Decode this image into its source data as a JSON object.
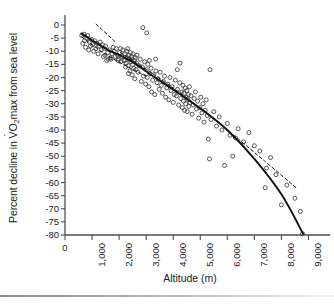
{
  "figure": {
    "background_color": "#ffffff",
    "axis_color": "#4d4d4d",
    "marker_color": "#3a3a3a",
    "fit_color": "#111111",
    "bottom_rule": "gradient-gray"
  },
  "axis_titles": {
    "y_prefix": "Percent decline in ",
    "y_v": "V",
    "y_o": "O",
    "y_sub": "2",
    "y_suffix": "max from sea level",
    "y_full": "Percent decline in VO2max from sea level",
    "x": "Altitude (m)"
  },
  "chart_data": {
    "type": "scatter",
    "title": "",
    "xlabel": "Altitude (m)",
    "ylabel": "Percent decline in VO2max from sea level",
    "xlim": [
      0,
      9500
    ],
    "ylim": [
      -80,
      2
    ],
    "grid": false,
    "legend": "none",
    "xticks": [
      0,
      1000,
      2000,
      3000,
      4000,
      5000,
      6000,
      7000,
      8000,
      9000
    ],
    "xtick_labels": [
      "0",
      "1,000",
      "2,000",
      "3,000",
      "4,000",
      "5,000",
      "6,000",
      "7,000",
      "8,000",
      "9,000"
    ],
    "yticks": [
      0,
      -5,
      -10,
      -15,
      -20,
      -25,
      -30,
      -35,
      -40,
      -45,
      -50,
      -55,
      -60,
      -65,
      -70,
      -75,
      -80
    ],
    "ytick_labels": [
      "0",
      "-5",
      "-10",
      "-15",
      "-20",
      "-25",
      "-30",
      "-35",
      "-40",
      "-45",
      "-50",
      "-55",
      "-60",
      "-65",
      "-70",
      "-75",
      "-80"
    ],
    "marker": "open-circle",
    "marker_size": 4,
    "points": [
      [
        620,
        -4.0
      ],
      [
        660,
        -7.0
      ],
      [
        700,
        -3.5
      ],
      [
        720,
        -6.0
      ],
      [
        760,
        -8.5
      ],
      [
        800,
        -5.0
      ],
      [
        840,
        -4.0
      ],
      [
        880,
        -9.5
      ],
      [
        900,
        -6.5
      ],
      [
        940,
        -8.0
      ],
      [
        980,
        -5.5
      ],
      [
        1020,
        -7.5
      ],
      [
        1060,
        -10.0
      ],
      [
        1100,
        -6.0
      ],
      [
        1140,
        -9.0
      ],
      [
        1180,
        -7.0
      ],
      [
        1220,
        -11.0
      ],
      [
        1260,
        -8.0
      ],
      [
        1300,
        -6.5
      ],
      [
        1340,
        -9.5
      ],
      [
        1380,
        -7.5
      ],
      [
        1420,
        -12.0
      ],
      [
        1460,
        -9.0
      ],
      [
        1500,
        -8.0
      ],
      [
        1540,
        -13.5
      ],
      [
        1580,
        -10.5
      ],
      [
        1600,
        -13.0
      ],
      [
        1640,
        -9.5
      ],
      [
        1680,
        -12.5
      ],
      [
        1700,
        -13.0
      ],
      [
        1740,
        -11.0
      ],
      [
        1780,
        -8.5
      ],
      [
        1820,
        -10.0
      ],
      [
        1860,
        -12.0
      ],
      [
        1900,
        -9.0
      ],
      [
        1940,
        -11.5
      ],
      [
        1980,
        -13.0
      ],
      [
        2020,
        -10.5
      ],
      [
        2060,
        -14.0
      ],
      [
        2100,
        -12.0
      ],
      [
        2140,
        -9.5
      ],
      [
        2180,
        -13.5
      ],
      [
        2220,
        -11.0
      ],
      [
        2240,
        -16.0
      ],
      [
        2260,
        -14.5
      ],
      [
        2280,
        -10.0
      ],
      [
        2300,
        -12.5
      ],
      [
        2320,
        -9.0
      ],
      [
        2340,
        -15.5
      ],
      [
        2360,
        -11.5
      ],
      [
        2380,
        -13.0
      ],
      [
        2400,
        -17.5
      ],
      [
        2420,
        -10.5
      ],
      [
        2440,
        -14.0
      ],
      [
        2460,
        -12.0
      ],
      [
        2480,
        -19.0
      ],
      [
        2500,
        -15.0
      ],
      [
        2520,
        -11.0
      ],
      [
        2540,
        -16.5
      ],
      [
        2560,
        -13.5
      ],
      [
        2580,
        -20.5
      ],
      [
        2600,
        -12.5
      ],
      [
        2620,
        -17.0
      ],
      [
        2640,
        -14.5
      ],
      [
        2660,
        -11.5
      ],
      [
        2700,
        -18.0
      ],
      [
        2740,
        -15.5
      ],
      [
        2780,
        -13.0
      ],
      [
        2820,
        -21.5
      ],
      [
        2860,
        -16.0
      ],
      [
        2880,
        -1.0
      ],
      [
        2900,
        -19.5
      ],
      [
        2940,
        -14.0
      ],
      [
        2980,
        -22.5
      ],
      [
        3000,
        -17.0
      ],
      [
        3020,
        -3.0
      ],
      [
        3040,
        -20.0
      ],
      [
        3060,
        -15.0
      ],
      [
        3100,
        -23.5
      ],
      [
        3140,
        -18.5
      ],
      [
        3180,
        -16.5
      ],
      [
        3200,
        -25.5
      ],
      [
        3240,
        -21.0
      ],
      [
        3280,
        -19.0
      ],
      [
        3320,
        -26.5
      ],
      [
        3360,
        -17.5
      ],
      [
        3400,
        -22.0
      ],
      [
        3440,
        -20.5
      ],
      [
        3480,
        -24.5
      ],
      [
        3520,
        -18.0
      ],
      [
        3560,
        -23.0
      ],
      [
        3600,
        -26.0
      ],
      [
        3640,
        -21.5
      ],
      [
        3680,
        -19.5
      ],
      [
        3720,
        -27.5
      ],
      [
        3760,
        -24.0
      ],
      [
        3800,
        -22.5
      ],
      [
        3840,
        -28.5
      ],
      [
        3880,
        -20.0
      ],
      [
        3920,
        -25.0
      ],
      [
        3960,
        -23.5
      ],
      [
        4000,
        -29.5
      ],
      [
        4040,
        -26.5
      ],
      [
        4080,
        -21.0
      ],
      [
        4120,
        -27.0
      ],
      [
        4160,
        -24.5
      ],
      [
        4200,
        -30.5
      ],
      [
        4240,
        -22.0
      ],
      [
        4280,
        -28.0
      ],
      [
        4320,
        -25.5
      ],
      [
        4340,
        -31.5
      ],
      [
        4360,
        -23.0
      ],
      [
        4380,
        -29.0
      ],
      [
        4400,
        -26.0
      ],
      [
        4420,
        -32.5
      ],
      [
        4440,
        -24.0
      ],
      [
        4460,
        -30.0
      ],
      [
        4480,
        -27.5
      ],
      [
        4500,
        -25.0
      ],
      [
        4520,
        -33.0
      ],
      [
        4540,
        -28.5
      ],
      [
        4560,
        -26.5
      ],
      [
        4580,
        -31.0
      ],
      [
        4600,
        -23.5
      ],
      [
        4620,
        -29.5
      ],
      [
        4660,
        -27.0
      ],
      [
        4700,
        -34.0
      ],
      [
        4740,
        -30.5
      ],
      [
        4780,
        -28.0
      ],
      [
        4820,
        -25.5
      ],
      [
        4860,
        -32.0
      ],
      [
        4900,
        -29.0
      ],
      [
        4940,
        -35.5
      ],
      [
        4980,
        -31.5
      ],
      [
        5020,
        -27.5
      ],
      [
        5060,
        -33.5
      ],
      [
        5100,
        -30.0
      ],
      [
        5140,
        -37.0
      ],
      [
        5180,
        -32.5
      ],
      [
        5220,
        -28.5
      ],
      [
        5260,
        -34.5
      ],
      [
        5300,
        -43.5
      ],
      [
        5340,
        -51.0
      ],
      [
        5360,
        -17.0
      ],
      [
        5400,
        -36.0
      ],
      [
        5500,
        -33.0
      ],
      [
        5600,
        -38.5
      ],
      [
        5700,
        -35.0
      ],
      [
        5800,
        -40.0
      ],
      [
        5900,
        -53.5
      ],
      [
        6000,
        -37.5
      ],
      [
        6100,
        -42.0
      ],
      [
        6200,
        -50.0
      ],
      [
        6300,
        -43.0
      ],
      [
        6400,
        -39.5
      ],
      [
        6600,
        -44.5
      ],
      [
        6800,
        -41.0
      ],
      [
        7000,
        -46.0
      ],
      [
        7200,
        -48.0
      ],
      [
        7400,
        -62.0
      ],
      [
        7450,
        -54.5
      ],
      [
        7600,
        -50.5
      ],
      [
        7800,
        -57.0
      ],
      [
        8000,
        -68.5
      ],
      [
        8200,
        -61.0
      ],
      [
        8500,
        -66.0
      ],
      [
        8700,
        -71.0
      ],
      [
        8780,
        -79.5
      ],
      [
        1480,
        -11.5
      ],
      [
        2210,
        -13.5
      ],
      [
        2350,
        -18.5
      ],
      [
        2470,
        -13.0
      ],
      [
        3120,
        -13.5
      ],
      [
        3350,
        -13.0
      ],
      [
        4150,
        -17.0
      ],
      [
        4250,
        -14.5
      ],
      [
        2050,
        -9.0
      ],
      [
        1960,
        -13.5
      ]
    ],
    "fits": [
      {
        "name": "solid-curve",
        "style": "solid",
        "label": "",
        "knots": [
          [
            600,
            -3.2
          ],
          [
            1500,
            -9.0
          ],
          [
            2400,
            -13.5
          ],
          [
            3300,
            -19.8
          ],
          [
            4200,
            -26.0
          ],
          [
            5100,
            -32.5
          ],
          [
            6000,
            -40.0
          ],
          [
            7000,
            -51.0
          ],
          [
            8000,
            -64.5
          ],
          [
            8800,
            -79.5
          ]
        ]
      },
      {
        "name": "dashed-line",
        "style": "dashed",
        "label": "",
        "knots": [
          [
            2050,
            -10.5
          ],
          [
            3300,
            -19.0
          ],
          [
            4600,
            -28.5
          ],
          [
            6000,
            -40.0
          ],
          [
            7400,
            -52.0
          ],
          [
            8600,
            -62.5
          ]
        ]
      },
      {
        "name": "dashed-segment-upper",
        "style": "dashed",
        "label": "",
        "knots": [
          [
            1150,
            0.3
          ],
          [
            1900,
            -6.8
          ]
        ]
      },
      {
        "name": "dashed-segment-lower-mid",
        "style": "dashed",
        "label": "",
        "knots": [
          [
            620,
            -4.5
          ],
          [
            1450,
            -10.8
          ],
          [
            2250,
            -15.5
          ],
          [
            3000,
            -19.5
          ]
        ]
      }
    ]
  }
}
